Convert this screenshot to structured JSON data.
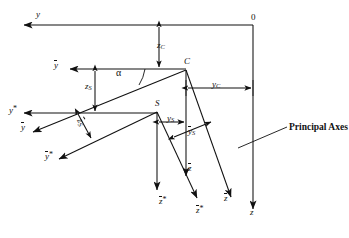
{
  "figure": {
    "type": "technical-line-diagram",
    "background_color": "#ffffff",
    "line_color": "#111111",
    "annotation": {
      "text": "Principal Axes",
      "style": "bold-serif"
    }
  },
  "points": [
    {
      "id": "O",
      "label": "0",
      "x": 253,
      "y": 20,
      "marker": "none"
    },
    {
      "id": "C",
      "label": "C",
      "x": 186,
      "y": 70,
      "marker": "filled-dot"
    },
    {
      "id": "S",
      "label": "S",
      "x": 157,
      "y": 112,
      "marker": "filled-dot"
    }
  ],
  "axis_labels": {
    "y": {
      "text": "y",
      "bar": false,
      "star": false,
      "x": 36,
      "y": 11
    },
    "y_bar": {
      "text": "y",
      "bar": true,
      "star": false,
      "x": 54,
      "y": 62
    },
    "y_star": {
      "text": "y",
      "bar": false,
      "star": true,
      "x": 10,
      "y": 106
    },
    "y_bar2": {
      "text": "y",
      "bar": true,
      "star": false,
      "x": 21,
      "y": 124
    },
    "y_barstar": {
      "text": "y",
      "bar": true,
      "star": true,
      "x": 45,
      "y": 152
    },
    "z": {
      "text": "z",
      "bar": false,
      "star": false,
      "x": 247,
      "y": 206
    },
    "z_bar": {
      "text": "z",
      "bar": true,
      "star": false,
      "x": 224,
      "y": 196
    },
    "z_bar2": {
      "text": "z",
      "bar": true,
      "star": false,
      "x": 182,
      "y": 165
    },
    "z_star": {
      "text": "z",
      "bar": false,
      "star": true,
      "x": 158,
      "y": 198
    },
    "z_barstar": {
      "text": "z",
      "bar": true,
      "star": true,
      "x": 196,
      "y": 207
    }
  },
  "dimension_labels": {
    "z_C": {
      "base": "z",
      "sub": "C",
      "bar": false,
      "x": 159,
      "y": 45
    },
    "y_C": {
      "base": "y",
      "sub": "C",
      "bar": false,
      "x": 214,
      "y": 83
    },
    "z_S": {
      "base": "z",
      "sub": "S",
      "bar": false,
      "x": 95,
      "y": 85
    },
    "z_S_bar": {
      "base": "z",
      "sub": "S",
      "bar": true,
      "x": 79,
      "y": 124
    },
    "y_S": {
      "base": "y",
      "sub": "S",
      "bar": false,
      "x": 171,
      "y": 128
    },
    "y_S_bar": {
      "base": "y",
      "sub": "S",
      "bar": true,
      "x": 190,
      "y": 133
    },
    "alpha": {
      "base": "α",
      "sub": "",
      "bar": false,
      "x": 117,
      "y": 73
    }
  },
  "geometry": {
    "y_axis_line": {
      "x1": 22,
      "y1": 25,
      "x2": 253,
      "y2": 25,
      "arrow": "start"
    },
    "o_vertical": {
      "x1": 253,
      "y1": 25,
      "x2": 253,
      "y2": 212,
      "arrow": "end"
    },
    "y_bar_line": {
      "x1": 68,
      "y1": 69,
      "x2": 186,
      "y2": 69,
      "arrow": "start"
    },
    "y_star_line": {
      "x1": 22,
      "y1": 113,
      "x2": 157,
      "y2": 113,
      "arrow": "start"
    },
    "y_bar_diag": {
      "x1": 31,
      "y1": 133,
      "x2": 186,
      "y2": 70,
      "arrow": "start"
    },
    "y_barstar_diag": {
      "x1": 57,
      "y1": 160,
      "x2": 157,
      "y2": 112,
      "arrow": "start"
    },
    "c_vertical": {
      "x1": 186,
      "y1": 70,
      "x2": 186,
      "y2": 178,
      "arrow": "end"
    },
    "c_diag": {
      "x1": 186,
      "y1": 70,
      "x2": 232,
      "y2": 200,
      "arrow": "end"
    },
    "s_vertical": {
      "x1": 157,
      "y1": 112,
      "x2": 157,
      "y2": 192,
      "arrow": "end"
    },
    "s_diag": {
      "x1": 157,
      "y1": 112,
      "x2": 198,
      "y2": 200,
      "arrow": "end"
    },
    "zc_dim": {
      "x1": 159,
      "y1": 25,
      "x2": 159,
      "y2": 69
    },
    "zs_dim": {
      "x1": 95,
      "y1": 69,
      "x2": 95,
      "y2": 113
    },
    "yc_dim": {
      "x1": 186,
      "y1": 88,
      "x2": 253,
      "y2": 88
    },
    "ys_dim": {
      "x1": 157,
      "y1": 122,
      "x2": 186,
      "y2": 122
    },
    "ys_bar_dim": {
      "x1": 172,
      "y1": 138,
      "x2": 213,
      "y2": 122
    },
    "zs_bar_dim": {
      "x1": 77,
      "y1": 112,
      "x2": 92,
      "y2": 140
    },
    "leader_line": {
      "x1": 240,
      "y1": 147,
      "x2": 286,
      "y2": 127
    }
  }
}
